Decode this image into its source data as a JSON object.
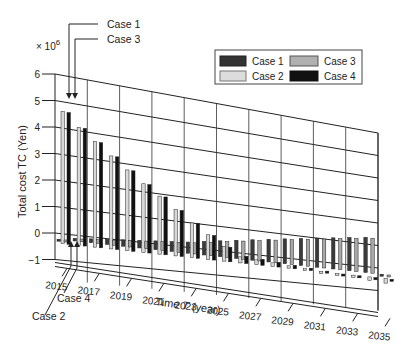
{
  "chart_data": {
    "type": "bar",
    "subtype": "3d-grouped-bar",
    "title": "",
    "xlabel": "Time T (year)",
    "ylabel": "Total cost TC (Yen)",
    "y_multiplier": "× 10^6",
    "ylim": [
      -1,
      6
    ],
    "yticks": [
      -1,
      0,
      1,
      2,
      3,
      4,
      5,
      6
    ],
    "xticks": [
      "2015",
      "2017",
      "2019",
      "2021",
      "2023",
      "2025",
      "2027",
      "2029",
      "2031",
      "2033",
      "2035"
    ],
    "grid": true,
    "legend_position": "top-right",
    "legend": [
      "Case 1",
      "Case 2",
      "Case 3",
      "Case 4"
    ],
    "annotations": [
      "Case 1",
      "Case 3",
      "Case 2",
      "Case 4"
    ],
    "categories": [
      2015,
      2016,
      2017,
      2018,
      2019,
      2020,
      2021,
      2022,
      2023,
      2024,
      2025,
      2026,
      2027,
      2028,
      2029,
      2030,
      2031,
      2032,
      2033,
      2034,
      2035
    ],
    "series": [
      {
        "name": "Case 1",
        "color": "#3a3a3a",
        "values": [
          0.0,
          0.1,
          0.15,
          0.2,
          0.25,
          0.3,
          0.35,
          0.4,
          0.45,
          0.55,
          0.65,
          0.75,
          0.85,
          0.95,
          1.05,
          1.15,
          1.25,
          1.35,
          1.45,
          1.55,
          0.0
        ]
      },
      {
        "name": "Case 2",
        "color": "#d8d8d8",
        "values": [
          5.0,
          4.5,
          4.05,
          3.6,
          3.15,
          2.7,
          2.3,
          1.85,
          1.4,
          1.0,
          0.6,
          0.25,
          0.2,
          0.15,
          0.1,
          0.05,
          0.0,
          -0.05,
          -0.1,
          -0.15,
          -0.2
        ]
      },
      {
        "name": "Case 3",
        "color": "#a8a8a8",
        "values": [
          0.0,
          0.1,
          0.15,
          0.2,
          0.25,
          0.3,
          0.35,
          0.4,
          0.45,
          0.55,
          0.65,
          0.75,
          0.85,
          0.95,
          1.05,
          1.15,
          1.25,
          1.35,
          1.45,
          1.55,
          0.0
        ]
      },
      {
        "name": "Case 4",
        "color": "#111111",
        "values": [
          5.0,
          4.5,
          4.05,
          3.6,
          3.15,
          2.7,
          2.3,
          1.85,
          1.4,
          1.0,
          0.6,
          0.3,
          0.25,
          0.2,
          0.15,
          0.1,
          0.05,
          0.0,
          -0.05,
          -0.1,
          0.0
        ]
      }
    ]
  },
  "labels": {
    "multiplier_base": "× 10",
    "multiplier_exp": "6",
    "ylabel": "Total cost TC (Yen)",
    "xlabel_prefix": "Time ",
    "xlabel_var": "T",
    "xlabel_suffix": " (year)",
    "callout_case1": "Case 1",
    "callout_case3": "Case 3",
    "callout_case4": "Case 4",
    "callout_case2": "Case 2"
  },
  "legend": {
    "items": [
      {
        "label": "Case 1",
        "color": "#333333"
      },
      {
        "label": "Case 3",
        "color": "#b0b0b0"
      },
      {
        "label": "Case 2",
        "color": "#dcdcdc"
      },
      {
        "label": "Case 4",
        "color": "#111111"
      }
    ]
  }
}
